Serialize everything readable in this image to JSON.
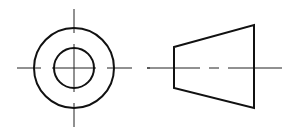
{
  "diagram": {
    "type": "orthographic-projection",
    "colors": {
      "background": "#ffffff",
      "outline": "#111111",
      "centerline": "#222222"
    },
    "views": [
      {
        "name": "end-view",
        "center": [
          74,
          68
        ],
        "outer_circle_radius": 40,
        "inner_circle_radius": 20,
        "centerlines": {
          "horizontal": [
            [
              17,
              41
            ],
            [
              52,
              96
            ],
            [
              107,
              132
            ]
          ],
          "vertical": [
            [
              9,
              33
            ],
            [
              44,
              92
            ],
            [
              103,
              127
            ]
          ]
        },
        "stray_dash": [
          147,
          150
        ]
      },
      {
        "name": "side-view",
        "trapezoid": [
          [
            174,
            47
          ],
          [
            254,
            25
          ],
          [
            254,
            108
          ],
          [
            174,
            88
          ]
        ],
        "centerline_y": 68,
        "centerline_segments": [
          [
            147,
            200
          ],
          [
            209,
            219
          ],
          [
            228,
            282
          ]
        ]
      }
    ]
  }
}
